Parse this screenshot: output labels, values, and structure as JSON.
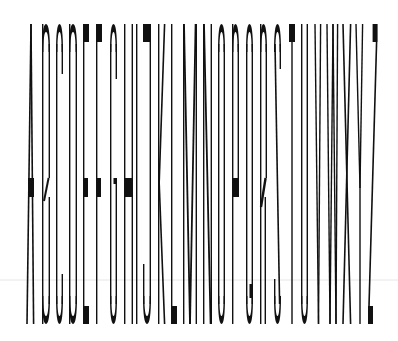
{
  "artwork": {
    "title": "Condensed Alphabet",
    "text": "ABCDEFGHIJKLMNOPQRSTUVWXYZ",
    "ink": "#111111",
    "guide_line_color": "#e6e6e6",
    "guide_line_y": 280,
    "top": 24,
    "bottom": 324,
    "mid_top": 178,
    "mid_bottom": 197,
    "letters": [
      {
        "char": "A",
        "x": 27,
        "w": 8
      },
      {
        "char": "B",
        "x": 42,
        "w": 8
      },
      {
        "char": "C",
        "x": 56,
        "w": 7
      },
      {
        "char": "D",
        "x": 69,
        "w": 8
      },
      {
        "char": "E",
        "x": 83,
        "w": 6
      },
      {
        "char": "F",
        "x": 96,
        "w": 6
      },
      {
        "char": "G",
        "x": 110,
        "w": 7
      },
      {
        "char": "H",
        "x": 124,
        "w": 9
      },
      {
        "char": "I",
        "x": 136,
        "w": 2
      },
      {
        "char": "J",
        "x": 143,
        "w": 8
      },
      {
        "char": "K",
        "x": 158,
        "w": 8
      },
      {
        "char": "L",
        "x": 171,
        "w": 6
      },
      {
        "char": "M",
        "x": 183,
        "w": 14
      },
      {
        "char": "N",
        "x": 203,
        "w": 9
      },
      {
        "char": "O",
        "x": 218,
        "w": 7
      },
      {
        "char": "P",
        "x": 232,
        "w": 7
      },
      {
        "char": "Q",
        "x": 246,
        "w": 7
      },
      {
        "char": "R",
        "x": 260,
        "w": 7
      },
      {
        "char": "S",
        "x": 274,
        "w": 7
      },
      {
        "char": "T",
        "x": 289,
        "w": 6
      },
      {
        "char": "U",
        "x": 301,
        "w": 7
      },
      {
        "char": "V",
        "x": 315,
        "w": 7
      },
      {
        "char": "W",
        "x": 327,
        "w": 12
      },
      {
        "char": "X",
        "x": 343,
        "w": 9
      },
      {
        "char": "Y",
        "x": 356,
        "w": 8
      },
      {
        "char": "Z",
        "x": 368,
        "w": 10
      }
    ]
  }
}
